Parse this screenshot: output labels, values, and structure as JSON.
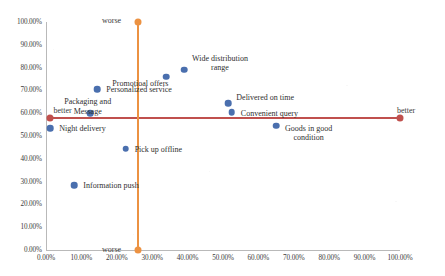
{
  "chart_data": {
    "type": "scatter",
    "title": "",
    "xlabel": "",
    "ylabel": "",
    "xlim": [
      0,
      100
    ],
    "ylim": [
      0,
      100
    ],
    "grid": false,
    "legend": "none",
    "axis_tick_suffix": "%",
    "x_ticks": [
      "0.00%",
      "10.00%",
      "20.00%",
      "30.00%",
      "40.00%",
      "50.00%",
      "60.00%",
      "70.00%",
      "80.00%",
      "90.00%",
      "100.00%"
    ],
    "x_tick_values": [
      0,
      10,
      20,
      30,
      40,
      50,
      60,
      70,
      80,
      90,
      100
    ],
    "y_ticks": [
      "0.00%",
      "10.00%",
      "20.00%",
      "30.00%",
      "40.00%",
      "50.00%",
      "60.00%",
      "70.00%",
      "80.00%",
      "90.00%",
      "100.00%"
    ],
    "y_tick_values": [
      0,
      10,
      20,
      30,
      40,
      50,
      60,
      70,
      80,
      90,
      100
    ],
    "point_color": "#4a6fae",
    "reference_lines": [
      {
        "name": "horizontal-better-axis",
        "orientation": "horizontal",
        "value": 58,
        "from": 1,
        "to": 100,
        "color": "#c0504d",
        "start_label": "better",
        "end_label": "better"
      },
      {
        "name": "vertical-worse-axis",
        "orientation": "vertical",
        "value": 26,
        "from": 0,
        "to": 100,
        "color": "#ec9242",
        "start_label": "worse",
        "end_label": "worse"
      }
    ],
    "points": [
      {
        "label": "Information push",
        "x": 8.0,
        "y": 28.5,
        "label_dx": 9,
        "label_dy": -4
      },
      {
        "label": "Night delivery",
        "x": 1.2,
        "y": 53.5,
        "label_dx": 9,
        "label_dy": -4
      },
      {
        "label": "Packaging and\nMessage",
        "x": 12.5,
        "y": 60.0,
        "label_dx": -26,
        "label_dy": -16
      },
      {
        "label": "Personalized service",
        "x": 14.5,
        "y": 70.5,
        "label_dx": 9,
        "label_dy": -4
      },
      {
        "label": "Pick up offline",
        "x": 22.5,
        "y": 44.5,
        "label_dx": 9,
        "label_dy": -4
      },
      {
        "label": "Promotioal offers",
        "x": 34.0,
        "y": 76.0,
        "label_dx": -54,
        "label_dy": 2
      },
      {
        "label": "Wide distribution\nrange",
        "x": 39.0,
        "y": 79.0,
        "label_dx": 8,
        "label_dy": -16
      },
      {
        "label": "Delivered on time",
        "x": 51.5,
        "y": 64.5,
        "label_dx": 8,
        "label_dy": -10
      },
      {
        "label": "Convenient query",
        "x": 52.5,
        "y": 60.5,
        "label_dx": 9,
        "label_dy": -3
      },
      {
        "label": "Goods in good\ncondition",
        "x": 65.0,
        "y": 54.5,
        "label_dx": 9,
        "label_dy": -2
      }
    ]
  }
}
